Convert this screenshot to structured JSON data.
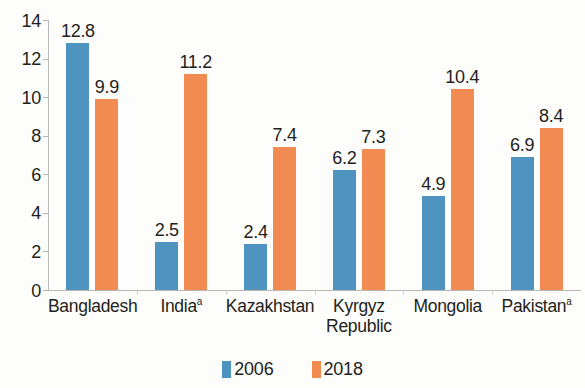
{
  "chart_data": {
    "type": "bar",
    "title": "",
    "subtitle": "",
    "xlabel": "",
    "ylabel": "",
    "ylim": [
      0,
      14
    ],
    "ytick_step": 2,
    "yticks": [
      "14",
      "12",
      "10",
      "8",
      "6",
      "4",
      "2",
      "0"
    ],
    "grid": false,
    "legend_position": "bottom-center",
    "categories": [
      "Bangladesh",
      "India",
      "Kazakhstan",
      "Kyrgyz Republic",
      "Mongolia",
      "Pakistan"
    ],
    "category_labels": [
      {
        "line1": "Bangladesh",
        "line2": "",
        "footnote": ""
      },
      {
        "line1": "India",
        "line2": "",
        "footnote": "a"
      },
      {
        "line1": "Kazakhstan",
        "line2": "",
        "footnote": ""
      },
      {
        "line1": "Kyrgyz",
        "line2": "Republic",
        "footnote": ""
      },
      {
        "line1": "Mongolia",
        "line2": "",
        "footnote": ""
      },
      {
        "line1": "Pakistan",
        "line2": "",
        "footnote": "a"
      }
    ],
    "series": [
      {
        "name": "2006",
        "color": "#4f93c0",
        "values": [
          12.8,
          2.5,
          2.4,
          6.2,
          4.9,
          6.9
        ],
        "labels": [
          "12.8",
          "2.5",
          "2.4",
          "6.2",
          "4.9",
          "6.9"
        ]
      },
      {
        "name": "2018",
        "color": "#f28b52",
        "values": [
          9.9,
          11.2,
          7.4,
          7.3,
          10.4,
          8.4
        ],
        "labels": [
          "9.9",
          "11.2",
          "7.4",
          "7.3",
          "10.4",
          "8.4"
        ]
      }
    ]
  },
  "legend": {
    "items": [
      {
        "label": "2006",
        "color": "#4f93c0"
      },
      {
        "label": "2018",
        "color": "#f28b52"
      }
    ]
  },
  "colors": {
    "series_2006": "#4f93c0",
    "series_2018": "#f28b52",
    "axis": "#b9b7b4",
    "text": "#231f20",
    "background": "#fdfdfb"
  }
}
